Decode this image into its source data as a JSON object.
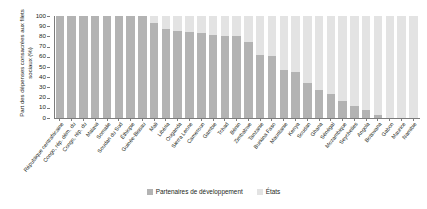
{
  "chart_data": {
    "type": "bar",
    "subtype": "stacked-bar-100-percent",
    "title": "",
    "xlabel": "",
    "ylabel": "Part des dépenses consacrées aux filets sociaux (%)",
    "ylim": [
      0,
      100
    ],
    "yticks": [
      0,
      10,
      20,
      30,
      40,
      50,
      60,
      70,
      80,
      90,
      100
    ],
    "ytick_labels": [
      "0",
      "10",
      "20",
      "30",
      "40",
      "50",
      "60",
      "70",
      "80",
      "90",
      "100"
    ],
    "grid": false,
    "legend_position": "bottom-center",
    "legend": [
      "Partenaires de développement",
      "États"
    ],
    "colors": {
      "partenaires": "#b3b3b3",
      "etats": "#e3e3e3",
      "axis": "#7c7c7c",
      "text": "#231f20",
      "background": "#ffffff"
    },
    "categories": [
      "République centrafricaine",
      "Congo, rép. dém. du",
      "Congo, rép. du",
      "Malawi",
      "Somalie",
      "Soudan du Sud",
      "Éthiopie",
      "Guinée-Bissau",
      "Mali",
      "Libéria",
      "Ouganda",
      "Sierra Leone",
      "Cameroun",
      "Gambie",
      "Tchad",
      "Bénin",
      "Zimbabwe",
      "Tanzanie",
      "Burkina Faso",
      "Mauritanie",
      "Kenya",
      "Soudan",
      "Ghana",
      "Sénégal",
      "Mozambique",
      "Seychelles",
      "Angola",
      "Botswana",
      "Gabon",
      "Maurice",
      "Namibie"
    ],
    "series": [
      {
        "name": "Partenaires de développement",
        "color": "#b3b3b3",
        "values": [
          100,
          100,
          100,
          100,
          100,
          100,
          100,
          100,
          93,
          87,
          85,
          84,
          83,
          81,
          80,
          80,
          75,
          62,
          61,
          47,
          45,
          34,
          27,
          24,
          17,
          12,
          8,
          3,
          0,
          0,
          0
        ]
      },
      {
        "name": "États",
        "color": "#e3e3e3",
        "values": [
          0,
          0,
          0,
          0,
          0,
          0,
          0,
          0,
          7,
          13,
          15,
          16,
          17,
          19,
          20,
          20,
          25,
          38,
          39,
          53,
          55,
          66,
          73,
          76,
          83,
          88,
          92,
          97,
          100,
          100,
          100
        ]
      }
    ]
  }
}
